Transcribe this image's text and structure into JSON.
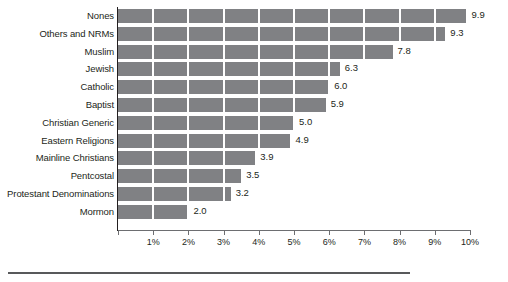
{
  "chart_data": {
    "type": "bar",
    "orientation": "horizontal",
    "title": "",
    "subtitle": "",
    "xlabel": "",
    "ylabel": "",
    "xlim": [
      0,
      10
    ],
    "xtick_values": [
      0,
      1,
      2,
      3,
      4,
      5,
      6,
      7,
      8,
      9,
      10
    ],
    "xtick_labels": [
      "",
      "1%",
      "2%",
      "3%",
      "4%",
      "5%",
      "6%",
      "7%",
      "8%",
      "9%",
      "10%"
    ],
    "grid": "vertical-white-gridlines-over-bars",
    "legend": "none",
    "bar_color": "#808184",
    "categories": [
      "Nones",
      "Others and NRMs",
      "Muslim",
      "Jewish",
      "Catholic",
      "Baptist",
      "Christian Generic",
      "Eastern Religions",
      "Mainline Christians",
      "Pentcostal",
      "Protestant Denominations",
      "Mormon"
    ],
    "values": [
      9.9,
      9.3,
      7.8,
      6.3,
      6.0,
      5.9,
      5.0,
      4.9,
      3.9,
      3.5,
      3.2,
      2.0
    ],
    "value_labels": [
      "9.9",
      "9.3",
      "7.8",
      "6.3",
      "6.0",
      "5.9",
      "5.0",
      "4.9",
      "3.9",
      "3.5",
      "3.2",
      "2.0"
    ]
  },
  "colors": {
    "bar": "#808184",
    "axis": "#231f20",
    "x_axis": "#6d6e71",
    "gridline": "#ffffff",
    "text": "#231f20",
    "footer_rule": "#58595b",
    "background": "#ffffff"
  }
}
